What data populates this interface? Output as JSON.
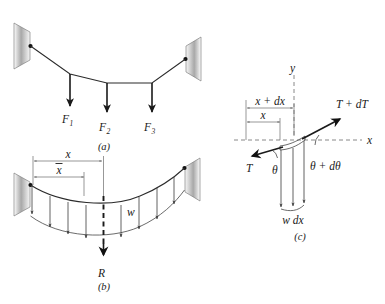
{
  "figure": {
    "panels": [
      {
        "id": "a",
        "caption": "(a)",
        "description": "Cable suspended between two wall supports carrying three concentrated loads",
        "load_labels": [
          {
            "base": "F",
            "sub": "1"
          },
          {
            "base": "F",
            "sub": "2"
          },
          {
            "base": "F",
            "sub": "3"
          }
        ]
      },
      {
        "id": "b",
        "caption": "(b)",
        "description": "Cable with distributed load w and resultant R located at x-bar",
        "dim_x": "x",
        "dim_xbar": "x",
        "dim_xbar_overbar": true,
        "load_intensity_label": "w",
        "resultant_label": "R"
      },
      {
        "id": "c",
        "caption": "(c)",
        "description": "Differential element of cable showing tensions and load w dx",
        "axis_y_label": "y",
        "axis_x_label": "x",
        "dim_x_plus_dx": "x + dx",
        "dim_x": "x",
        "tension_left_label": "T",
        "tension_right_label": "T + dT",
        "angle_left_label": "θ",
        "angle_right_label": "θ + dθ",
        "load_label": "w dx"
      }
    ]
  },
  "colors": {
    "background": "#ffffff",
    "ink": "#1a1a1a",
    "cable": "#2b2b2b",
    "thin_line": "#3a3a3a",
    "dimension_line": "#6b6b6b",
    "support_fill_dark": "#8f8f8f",
    "support_fill_light": "#fdfdfd"
  }
}
